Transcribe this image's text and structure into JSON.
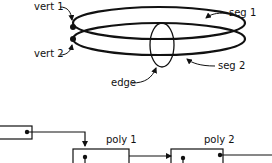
{
  "diagram": {
    "labels": {
      "vert1": "vert 1",
      "vert2": "vert 2",
      "seg1": "seg 1",
      "seg2": "seg 2",
      "edge": "edge",
      "poly1": "poly 1",
      "poly2": "poly 2"
    },
    "colors": {
      "ink": "#111111",
      "background": "#ffffff"
    }
  }
}
